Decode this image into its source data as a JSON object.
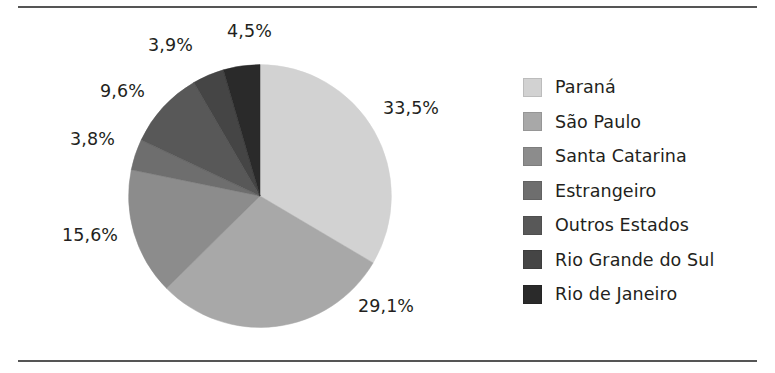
{
  "chart_data": {
    "type": "pie",
    "title": "",
    "subtitle": "",
    "xlabel": "",
    "ylabel": "",
    "legend_position": "right",
    "grid": false,
    "decimal_separator": ",",
    "start_angle_deg": 0,
    "direction": "clockwise",
    "categories": [
      "Paraná",
      "São Paulo",
      "Santa Catarina",
      "Estrangeiro",
      "Outros Estados",
      "Rio Grande do Sul",
      "Rio de Janeiro"
    ],
    "values": [
      33.5,
      29.1,
      15.6,
      3.8,
      9.6,
      3.9,
      4.5
    ],
    "value_labels": [
      "33,5%",
      "29,1%",
      "15,6%",
      "3,8%",
      "9,6%",
      "3,9%",
      "4,5%"
    ],
    "colors": [
      "#d2d2d2",
      "#a8a8a8",
      "#8c8c8c",
      "#6e6e6e",
      "#585858",
      "#454545",
      "#2a2a2a"
    ],
    "slices": [
      {
        "label": "Paraná",
        "value": 33.5,
        "value_label": "33,5%",
        "color": "#d2d2d2"
      },
      {
        "label": "São Paulo",
        "value": 29.1,
        "value_label": "29,1%",
        "color": "#a8a8a8"
      },
      {
        "label": "Santa Catarina",
        "value": 15.6,
        "value_label": "15,6%",
        "color": "#8c8c8c"
      },
      {
        "label": "Estrangeiro",
        "value": 3.8,
        "value_label": "3,8%",
        "color": "#6e6e6e"
      },
      {
        "label": "Outros Estados",
        "value": 9.6,
        "value_label": "9,6%",
        "color": "#585858"
      },
      {
        "label": "Rio Grande do Sul",
        "value": 3.9,
        "value_label": "3,9%",
        "color": "#454545"
      },
      {
        "label": "Rio de Janeiro",
        "value": 4.5,
        "value_label": "4,5%",
        "color": "#2a2a2a"
      }
    ]
  },
  "labels": {
    "parana_pct": {
      "text": "33,5%",
      "x": 383,
      "y": 98
    },
    "sao_paulo_pct": {
      "text": "29,1%",
      "x": 358,
      "y": 296
    },
    "santa_catarina_pct": {
      "text": "15,6%",
      "x": 62,
      "y": 225
    },
    "estrangeiro_pct": {
      "text": "3,8%",
      "x": 70,
      "y": 129
    },
    "outros_estados_pct": {
      "text": "9,6%",
      "x": 100,
      "y": 81
    },
    "rio_grande_do_sul_pct": {
      "text": "3,9%",
      "x": 148,
      "y": 35
    },
    "rio_de_janeiro_pct": {
      "text": "4,5%",
      "x": 227,
      "y": 21
    }
  },
  "legend": {
    "items": [
      {
        "label": "Paraná",
        "color": "#d2d2d2"
      },
      {
        "label": "São Paulo",
        "color": "#a8a8a8"
      },
      {
        "label": "Santa Catarina",
        "color": "#8c8c8c"
      },
      {
        "label": "Estrangeiro",
        "color": "#6e6e6e"
      },
      {
        "label": "Outros Estados",
        "color": "#585858"
      },
      {
        "label": "Rio Grande do Sul",
        "color": "#454545"
      },
      {
        "label": "Rio de Janeiro",
        "color": "#2a2a2a"
      }
    ]
  },
  "frame": {
    "rule_color": "#555555"
  }
}
